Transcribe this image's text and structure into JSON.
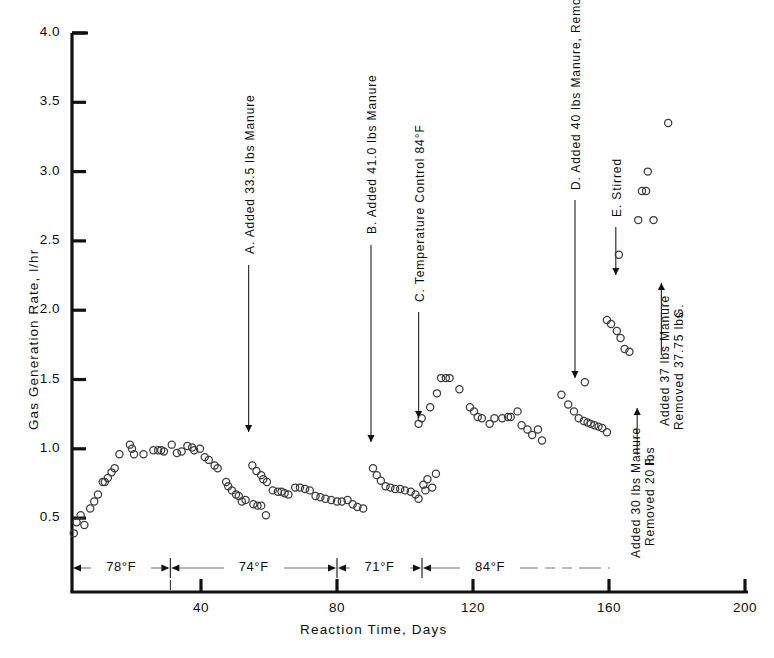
{
  "chart_data": {
    "type": "scatter",
    "title": "",
    "xlabel": "Reaction Time, Days",
    "ylabel": "Gas Generation Rate, l/hr",
    "xlim": [
      0,
      200
    ],
    "ylim": [
      0.3,
      4.0
    ],
    "xticks": [
      40,
      80,
      120,
      160,
      200
    ],
    "xtick_labels": [
      "40",
      "80",
      "120",
      "160",
      "200"
    ],
    "yticks": [
      0.5,
      1.0,
      1.5,
      2.0,
      2.5,
      3.0,
      3.5,
      4.0
    ],
    "ytick_labels": [
      "0.5",
      "1.0",
      "1.5",
      "2.0",
      "2.5",
      "3.0",
      "3.5",
      "4.0"
    ],
    "grid": false,
    "legend": false,
    "marker": "open-circle",
    "series": [
      {
        "name": "Gas generation rate",
        "points": [
          [
            2.6,
            0.39
          ],
          [
            3.4,
            0.47
          ],
          [
            4.6,
            0.52
          ],
          [
            5.7,
            0.45
          ],
          [
            7.4,
            0.57
          ],
          [
            8.6,
            0.62
          ],
          [
            9.7,
            0.67
          ],
          [
            11.1,
            0.76
          ],
          [
            11.7,
            0.76
          ],
          [
            12.6,
            0.79
          ],
          [
            13.7,
            0.83
          ],
          [
            14.6,
            0.86
          ],
          [
            16.0,
            0.96
          ],
          [
            19.1,
            1.03
          ],
          [
            19.7,
            1.0
          ],
          [
            20.3,
            0.96
          ],
          [
            23.1,
            0.96
          ],
          [
            26.0,
            0.99
          ],
          [
            27.4,
            0.99
          ],
          [
            28.3,
            0.99
          ],
          [
            29.1,
            0.98
          ],
          [
            31.4,
            1.03
          ],
          [
            32.9,
            0.97
          ],
          [
            34.3,
            0.98
          ],
          [
            36.0,
            1.02
          ],
          [
            37.4,
            1.01
          ],
          [
            38.0,
            0.99
          ],
          [
            39.7,
            1.0
          ],
          [
            41.1,
            0.94
          ],
          [
            42.3,
            0.92
          ],
          [
            44.0,
            0.88
          ],
          [
            44.9,
            0.86
          ],
          [
            47.4,
            0.76
          ],
          [
            48.0,
            0.73
          ],
          [
            49.1,
            0.7
          ],
          [
            50.3,
            0.67
          ],
          [
            51.1,
            0.66
          ],
          [
            52.0,
            0.62
          ],
          [
            53.1,
            0.63
          ],
          [
            55.4,
            0.6
          ],
          [
            56.6,
            0.59
          ],
          [
            57.7,
            0.59
          ],
          [
            59.1,
            0.52
          ],
          [
            55.1,
            0.88
          ],
          [
            56.3,
            0.84
          ],
          [
            57.7,
            0.81
          ],
          [
            58.3,
            0.78
          ],
          [
            59.4,
            0.76
          ],
          [
            61.1,
            0.7
          ],
          [
            62.6,
            0.69
          ],
          [
            63.7,
            0.69
          ],
          [
            64.6,
            0.68
          ],
          [
            65.7,
            0.67
          ],
          [
            67.7,
            0.72
          ],
          [
            69.1,
            0.72
          ],
          [
            70.6,
            0.71
          ],
          [
            72.0,
            0.7
          ],
          [
            73.7,
            0.66
          ],
          [
            75.1,
            0.65
          ],
          [
            76.6,
            0.64
          ],
          [
            78.3,
            0.63
          ],
          [
            80.0,
            0.62
          ],
          [
            81.4,
            0.62
          ],
          [
            83.1,
            0.63
          ],
          [
            84.6,
            0.6
          ],
          [
            86.0,
            0.58
          ],
          [
            87.7,
            0.57
          ],
          [
            90.6,
            0.86
          ],
          [
            91.7,
            0.81
          ],
          [
            92.9,
            0.77
          ],
          [
            94.3,
            0.73
          ],
          [
            95.7,
            0.72
          ],
          [
            97.1,
            0.71
          ],
          [
            98.6,
            0.71
          ],
          [
            100.0,
            0.7
          ],
          [
            101.7,
            0.69
          ],
          [
            103.1,
            0.67
          ],
          [
            104.0,
            0.64
          ],
          [
            105.4,
            0.74
          ],
          [
            106.6,
            0.78
          ],
          [
            106.0,
            0.7
          ],
          [
            108.0,
            0.72
          ],
          [
            109.1,
            0.82
          ],
          [
            104.0,
            1.18
          ],
          [
            104.9,
            1.22
          ],
          [
            107.4,
            1.3
          ],
          [
            109.4,
            1.4
          ],
          [
            110.6,
            1.51
          ],
          [
            112.0,
            1.51
          ],
          [
            113.1,
            1.51
          ],
          [
            116.0,
            1.43
          ],
          [
            119.1,
            1.3
          ],
          [
            120.3,
            1.27
          ],
          [
            121.4,
            1.23
          ],
          [
            122.6,
            1.22
          ],
          [
            124.9,
            1.18
          ],
          [
            126.3,
            1.22
          ],
          [
            128.6,
            1.22
          ],
          [
            130.3,
            1.23
          ],
          [
            131.1,
            1.23
          ],
          [
            133.1,
            1.27
          ],
          [
            134.3,
            1.17
          ],
          [
            136.0,
            1.14
          ],
          [
            137.4,
            1.1
          ],
          [
            139.1,
            1.14
          ],
          [
            140.3,
            1.06
          ],
          [
            146.0,
            1.39
          ],
          [
            148.0,
            1.32
          ],
          [
            149.7,
            1.27
          ],
          [
            151.1,
            1.22
          ],
          [
            152.6,
            1.2
          ],
          [
            153.7,
            1.19
          ],
          [
            154.6,
            1.18
          ],
          [
            155.7,
            1.17
          ],
          [
            156.9,
            1.16
          ],
          [
            158.0,
            1.15
          ],
          [
            159.4,
            1.12
          ],
          [
            152.9,
            1.48
          ],
          [
            159.4,
            1.93
          ],
          [
            160.6,
            1.9
          ],
          [
            162.3,
            1.85
          ],
          [
            163.4,
            1.8
          ],
          [
            164.6,
            1.72
          ],
          [
            166.0,
            1.7
          ],
          [
            162.9,
            2.4
          ],
          [
            168.6,
            2.65
          ],
          [
            169.7,
            2.86
          ],
          [
            170.9,
            2.86
          ],
          [
            171.4,
            3.0
          ],
          [
            173.1,
            2.65
          ],
          [
            177.4,
            3.35
          ]
        ]
      }
    ],
    "annotations": [
      {
        "id": "A",
        "text": "A. Added 33.5 lbs Manure",
        "target_x": 54,
        "target_y": 1.08
      },
      {
        "id": "B",
        "text": "B. Added 41.0 lbs Manure",
        "target_x": 90,
        "target_y": 1.0
      },
      {
        "id": "C",
        "text": "C. Temperature Control 84°F",
        "target_x": 104,
        "target_y": 1.32
      },
      {
        "id": "D",
        "text": "D. Added 40 lbs Manure, Removed 30 lbs",
        "target_x": 150,
        "target_y": 1.52
      },
      {
        "id": "E",
        "text": "E. Stirred",
        "target_x": 162,
        "target_y": 2.22
      },
      {
        "id": "F",
        "text": "F.",
        "text2": "Added 30 lbs Manure\n    Removed 20 lbs",
        "target_x": 168,
        "target_y": 2.02
      },
      {
        "id": "G",
        "text": "G.",
        "text2": "Added 37 lbs Manure\nRemoved 37.75 lbs",
        "target_x": 176,
        "target_y": 2.3
      }
    ],
    "temperature_bands": [
      {
        "label": "78°F",
        "from_day": 0,
        "to_day": 31
      },
      {
        "label": "74°F",
        "from_day": 31,
        "to_day": 80
      },
      {
        "label": "71°F",
        "from_day": 80,
        "to_day": 105
      },
      {
        "label": "84°F",
        "from_day": 105,
        "to_day": 145
      }
    ]
  },
  "axis": {
    "ylabel": "Gas Generation Rate, l/hr",
    "xlabel": "Reaction Time, Days"
  },
  "annotation_text": {
    "a": "A. Added 33.5 lbs Manure",
    "b": "B. Added 41.0 lbs Manure",
    "c": "C. Temperature Control 84°F",
    "d": "D. Added 40 lbs Manure, Removed 30 lbs",
    "e": "E. Stirred",
    "f_head": "F.",
    "f_line1": "Added 30 lbs Manure",
    "f_line2": "Removed 20 lbs",
    "g_head": "G.",
    "g_line1": "Added 37 lbs Manure",
    "g_line2": "Removed 37.75 lbs"
  },
  "bands": {
    "b1": "78°F",
    "b2": "74°F",
    "b3": "71°F",
    "b4": "84°F"
  }
}
